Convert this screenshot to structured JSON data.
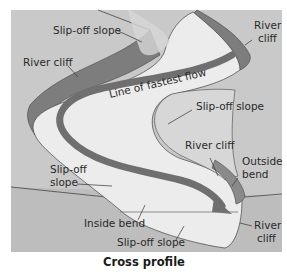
{
  "title": "Cross profile",
  "colors": {
    "background_panel": "#c9c9c9",
    "lower_panel": "#bdbdbd",
    "river_channel": "#ececec",
    "slip_off_slope": "#d7d7d7",
    "river_cliff": "#7d7d7d",
    "flow_line": "#6f6f6f",
    "label_text": "#2a2a2a"
  },
  "flow_label": "Line of fastest flow",
  "labels": {
    "slip_off_top": "Slip-off slope",
    "river_cliff_left": "River cliff",
    "river_cliff_top_right_1": "River",
    "river_cliff_top_right_2": "cliff",
    "slip_off_right": "Slip-off slope",
    "river_cliff_mid": "River cliff",
    "outside_bend_1": "Outside",
    "outside_bend_2": "bend",
    "slip_off_left_1": "Slip-off",
    "slip_off_left_2": "slope",
    "inside_bend": "Inside bend",
    "river_cliff_bottom_1": "River",
    "river_cliff_bottom_2": "cliff",
    "slip_off_bottom": "Slip-off slope"
  },
  "icons": {
    "flow_arrow": "arrow-icon"
  }
}
